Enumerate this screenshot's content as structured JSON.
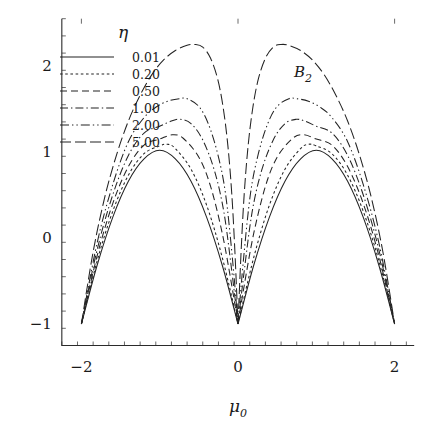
{
  "chart_data": {
    "type": "line",
    "title": "",
    "annotation": "B",
    "annotation_sub": "2",
    "xlabel": "μ",
    "xlabel_sub": "0",
    "ylabel": "",
    "legend_title": "η",
    "legend_position": "upper-left-inside",
    "grid": false,
    "xlim": [
      -2.25,
      2.25
    ],
    "ylim": [
      -1.25,
      2.55
    ],
    "xticks": [
      -2,
      0,
      2
    ],
    "xticklabels": [
      "−2",
      "0",
      "2"
    ],
    "xminor_step": 0.2,
    "yticks": [
      -1,
      0,
      1,
      2
    ],
    "yticklabels": [
      "−1",
      "0",
      "1",
      "2"
    ],
    "yminor_step": 0.2,
    "common_points": [
      [
        -2,
        -1
      ],
      [
        -1,
        1
      ],
      [
        0,
        -1
      ],
      [
        1,
        1
      ],
      [
        2,
        -1
      ]
    ],
    "series": [
      {
        "name": "0.01",
        "eta": 0.01,
        "dash": "none",
        "peak_left": {
          "x": -1.0,
          "y": 1.02
        },
        "peak_right": {
          "x": 1.0,
          "y": 1.02
        },
        "points_left": [
          [
            -2,
            -1
          ],
          [
            -1.8,
            -0.32
          ],
          [
            -1.6,
            0.24
          ],
          [
            -1.4,
            0.66
          ],
          [
            -1.2,
            0.92
          ],
          [
            -1.0,
            1.02
          ],
          [
            -0.8,
            0.92
          ],
          [
            -0.6,
            0.66
          ],
          [
            -0.4,
            0.24
          ],
          [
            -0.2,
            -0.32
          ],
          [
            0,
            -1
          ]
        ],
        "points_right": [
          [
            0,
            -1
          ],
          [
            0.2,
            -0.32
          ],
          [
            0.4,
            0.24
          ],
          [
            0.6,
            0.66
          ],
          [
            0.8,
            0.92
          ],
          [
            1.0,
            1.02
          ],
          [
            1.2,
            0.92
          ],
          [
            1.4,
            0.66
          ],
          [
            1.6,
            0.24
          ],
          [
            1.8,
            -0.32
          ],
          [
            2,
            -1
          ]
        ]
      },
      {
        "name": "0.20",
        "eta": 0.2,
        "dash": "2.6,2.6",
        "peak_left": {
          "x": -0.93,
          "y": 1.09
        },
        "peak_right": {
          "x": 0.93,
          "y": 1.09
        },
        "points_left": [
          [
            -2,
            -1
          ],
          [
            -1.8,
            -0.27
          ],
          [
            -1.6,
            0.31
          ],
          [
            -1.4,
            0.73
          ],
          [
            -1.2,
            0.98
          ],
          [
            -1.0,
            1.07
          ],
          [
            -0.9,
            1.09
          ],
          [
            -0.8,
            1.04
          ],
          [
            -0.6,
            0.8
          ],
          [
            -0.4,
            0.38
          ],
          [
            -0.2,
            -0.23
          ],
          [
            0,
            -1
          ]
        ],
        "points_right": [
          [
            0,
            -1
          ],
          [
            0.2,
            -0.23
          ],
          [
            0.4,
            0.38
          ],
          [
            0.6,
            0.8
          ],
          [
            0.8,
            1.04
          ],
          [
            0.9,
            1.09
          ],
          [
            1.0,
            1.07
          ],
          [
            1.2,
            0.98
          ],
          [
            1.4,
            0.73
          ],
          [
            1.6,
            0.31
          ],
          [
            1.8,
            -0.27
          ],
          [
            2,
            -1
          ]
        ]
      },
      {
        "name": "0.50",
        "eta": 0.5,
        "dash": "7,4",
        "peak_left": {
          "x": -0.84,
          "y": 1.2
        },
        "peak_right": {
          "x": 0.84,
          "y": 1.2
        },
        "points_left": [
          [
            -2,
            -1
          ],
          [
            -1.8,
            -0.21
          ],
          [
            -1.6,
            0.4
          ],
          [
            -1.4,
            0.83
          ],
          [
            -1.2,
            1.08
          ],
          [
            -1.0,
            1.15
          ],
          [
            -0.84,
            1.2
          ],
          [
            -0.7,
            1.16
          ],
          [
            -0.5,
            0.94
          ],
          [
            -0.35,
            0.6
          ],
          [
            -0.2,
            0.05
          ],
          [
            -0.08,
            -0.55
          ],
          [
            0,
            -1
          ]
        ],
        "points_right": [
          [
            0,
            -1
          ],
          [
            0.08,
            -0.55
          ],
          [
            0.2,
            0.05
          ],
          [
            0.35,
            0.6
          ],
          [
            0.5,
            0.94
          ],
          [
            0.7,
            1.16
          ],
          [
            0.84,
            1.2
          ],
          [
            1.0,
            1.15
          ],
          [
            1.2,
            1.08
          ],
          [
            1.4,
            0.83
          ],
          [
            1.6,
            0.4
          ],
          [
            1.8,
            -0.21
          ],
          [
            2,
            -1
          ]
        ]
      },
      {
        "name": "1.00",
        "eta": 1.0,
        "dash": "8,3,1.4,3",
        "peak_left": {
          "x": -0.74,
          "y": 1.38
        },
        "peak_right": {
          "x": 0.74,
          "y": 1.38
        },
        "points_left": [
          [
            -2,
            -1
          ],
          [
            -1.8,
            -0.14
          ],
          [
            -1.6,
            0.5
          ],
          [
            -1.4,
            0.96
          ],
          [
            -1.2,
            1.22
          ],
          [
            -1.0,
            1.3
          ],
          [
            -0.85,
            1.36
          ],
          [
            -0.74,
            1.38
          ],
          [
            -0.6,
            1.33
          ],
          [
            -0.45,
            1.14
          ],
          [
            -0.3,
            0.78
          ],
          [
            -0.18,
            0.3
          ],
          [
            -0.08,
            -0.38
          ],
          [
            0,
            -1
          ]
        ],
        "points_right": [
          [
            0,
            -1
          ],
          [
            0.08,
            -0.38
          ],
          [
            0.18,
            0.3
          ],
          [
            0.3,
            0.78
          ],
          [
            0.45,
            1.14
          ],
          [
            0.6,
            1.33
          ],
          [
            0.74,
            1.38
          ],
          [
            0.85,
            1.36
          ],
          [
            1.0,
            1.3
          ],
          [
            1.2,
            1.22
          ],
          [
            1.4,
            0.96
          ],
          [
            1.6,
            0.5
          ],
          [
            1.8,
            -0.14
          ],
          [
            2,
            -1
          ]
        ]
      },
      {
        "name": "2.00",
        "eta": 2.0,
        "dash": "9,3,1.4,3,1.4,3",
        "peak_left": {
          "x": -0.65,
          "y": 1.62
        },
        "peak_right": {
          "x": 0.65,
          "y": 1.62
        },
        "points_left": [
          [
            -2,
            -1
          ],
          [
            -1.8,
            -0.06
          ],
          [
            -1.6,
            0.62
          ],
          [
            -1.4,
            1.12
          ],
          [
            -1.2,
            1.4
          ],
          [
            -1.05,
            1.52
          ],
          [
            -0.9,
            1.59
          ],
          [
            -0.75,
            1.62
          ],
          [
            -0.65,
            1.62
          ],
          [
            -0.5,
            1.53
          ],
          [
            -0.38,
            1.33
          ],
          [
            -0.26,
            0.98
          ],
          [
            -0.16,
            0.52
          ],
          [
            -0.07,
            -0.25
          ],
          [
            0,
            -1
          ]
        ],
        "points_right": [
          [
            0,
            -1
          ],
          [
            0.07,
            -0.25
          ],
          [
            0.16,
            0.52
          ],
          [
            0.26,
            0.98
          ],
          [
            0.38,
            1.33
          ],
          [
            0.5,
            1.53
          ],
          [
            0.65,
            1.62
          ],
          [
            0.75,
            1.62
          ],
          [
            0.9,
            1.59
          ],
          [
            1.05,
            1.52
          ],
          [
            1.2,
            1.4
          ],
          [
            1.4,
            1.12
          ],
          [
            1.6,
            0.62
          ],
          [
            1.8,
            -0.06
          ],
          [
            2,
            -1
          ]
        ]
      },
      {
        "name": "5.00",
        "eta": 5.0,
        "dash": "11,4",
        "peak_left": {
          "x": -0.55,
          "y": 2.25
        },
        "peak_right": {
          "x": 0.55,
          "y": 2.25
        },
        "points_left": [
          [
            -2,
            -1
          ],
          [
            -1.85,
            -0.16
          ],
          [
            -1.7,
            0.48
          ],
          [
            -1.55,
            0.97
          ],
          [
            -1.4,
            1.36
          ],
          [
            -1.25,
            1.66
          ],
          [
            -1.1,
            1.9
          ],
          [
            -0.95,
            2.07
          ],
          [
            -0.8,
            2.18
          ],
          [
            -0.65,
            2.24
          ],
          [
            -0.55,
            2.25
          ],
          [
            -0.45,
            2.22
          ],
          [
            -0.35,
            2.09
          ],
          [
            -0.26,
            1.85
          ],
          [
            -0.19,
            1.52
          ],
          [
            -0.13,
            1.08
          ],
          [
            -0.08,
            0.52
          ],
          [
            -0.04,
            -0.15
          ],
          [
            0,
            -1
          ]
        ],
        "points_right": [
          [
            0,
            -1
          ],
          [
            0.04,
            -0.15
          ],
          [
            0.08,
            0.52
          ],
          [
            0.13,
            1.08
          ],
          [
            0.19,
            1.52
          ],
          [
            0.26,
            1.85
          ],
          [
            0.35,
            2.09
          ],
          [
            0.45,
            2.22
          ],
          [
            0.55,
            2.25
          ],
          [
            0.65,
            2.24
          ],
          [
            0.8,
            2.18
          ],
          [
            0.95,
            2.07
          ],
          [
            1.1,
            1.9
          ],
          [
            1.25,
            1.66
          ],
          [
            1.4,
            1.36
          ],
          [
            1.55,
            0.97
          ],
          [
            1.7,
            0.48
          ],
          [
            1.85,
            -0.16
          ],
          [
            2,
            -1
          ]
        ]
      }
    ]
  },
  "legend": {
    "title": "η",
    "entries": [
      {
        "label": "0.01"
      },
      {
        "label": "0.20"
      },
      {
        "label": "0.50"
      },
      {
        "label": "1.00"
      },
      {
        "label": "2.00"
      },
      {
        "label": "5.00"
      }
    ]
  },
  "axes": {
    "x_title": "μ",
    "x_title_sub": "0",
    "x_ticklabels": [
      "−2",
      "0",
      "2"
    ],
    "y_ticklabels": [
      "−1",
      "0",
      "1",
      "2"
    ]
  },
  "annotation": {
    "text": "B",
    "sub": "2"
  },
  "colors": {
    "line": "#232323",
    "axis": "#2b2b2b",
    "text": "#1a1a1a",
    "background": "#ffffff"
  }
}
